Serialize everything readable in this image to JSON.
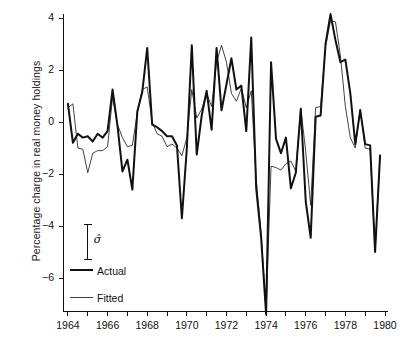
{
  "chart_data": {
    "type": "line",
    "title": "",
    "xlabel": "",
    "ylabel": "Percentage charge in real money holdings",
    "xlim": [
      1963.75,
      1980.0
    ],
    "ylim": [
      -7.8,
      4.4
    ],
    "yticks": [
      4,
      2,
      0,
      -2,
      -4,
      -6
    ],
    "ytick_labels": [
      "4",
      "2",
      "0",
      "−2",
      "−4",
      "−6"
    ],
    "xticks": [
      1964,
      1965,
      1966,
      1967,
      1968,
      1969,
      1970,
      1971,
      1972,
      1973,
      1974,
      1975,
      1976,
      1977,
      1978,
      1979,
      1980
    ],
    "xtick_labels_shown": [
      "1964",
      "1966",
      "1968",
      "1970",
      "1972",
      "1974",
      "1976",
      "1978",
      "1980"
    ],
    "xtick_labels_values": [
      1964,
      1966,
      1968,
      1970,
      1972,
      1974,
      1976,
      1978,
      1980
    ],
    "grid": false,
    "legend_position": "lower-left-inside",
    "annotations": [
      {
        "name": "sigma-hat-errorbar",
        "label": "σ̂",
        "x": 1965.0,
        "y_top": -3.95,
        "y_bottom": -5.3
      }
    ],
    "series": [
      {
        "name": "Actual",
        "style": "thick",
        "color": "#111111",
        "linewidth": 2.0,
        "x": [
          1964.0,
          1964.25,
          1964.5,
          1964.75,
          1965.0,
          1965.25,
          1965.5,
          1965.75,
          1966.0,
          1966.25,
          1966.5,
          1966.75,
          1967.0,
          1967.25,
          1967.5,
          1967.75,
          1968.0,
          1968.25,
          1968.5,
          1968.75,
          1969.0,
          1969.25,
          1969.5,
          1969.75,
          1970.0,
          1970.25,
          1970.5,
          1970.75,
          1971.0,
          1971.25,
          1971.5,
          1971.75,
          1972.0,
          1972.25,
          1972.5,
          1972.75,
          1973.0,
          1973.25,
          1973.5,
          1973.75,
          1974.0,
          1974.25,
          1974.5,
          1974.75,
          1975.0,
          1975.25,
          1975.5,
          1975.75,
          1976.0,
          1976.25,
          1976.5,
          1976.75,
          1977.0,
          1977.25,
          1977.5,
          1977.75,
          1978.0,
          1978.25,
          1978.5,
          1978.75,
          1979.0,
          1979.25,
          1979.5,
          1979.75
        ],
        "y": [
          0.7,
          -0.8,
          -0.45,
          -0.6,
          -0.55,
          -0.75,
          -0.45,
          -0.6,
          -0.35,
          1.25,
          -0.15,
          -1.9,
          -1.45,
          -2.6,
          0.4,
          1.15,
          2.85,
          -0.1,
          -0.2,
          -0.35,
          -0.55,
          -0.55,
          -0.9,
          -3.7,
          -1.0,
          2.95,
          -1.25,
          0.25,
          1.2,
          -0.3,
          2.85,
          0.45,
          1.45,
          2.45,
          1.25,
          1.4,
          -0.35,
          3.25,
          -2.55,
          -4.45,
          -7.4,
          2.3,
          -0.65,
          -1.2,
          -0.6,
          -2.55,
          -1.95,
          0.5,
          -3.05,
          -4.45,
          0.2,
          0.25,
          3.0,
          4.15,
          3.15,
          2.3,
          2.4,
          1.1,
          -0.85,
          0.45,
          -0.85,
          -0.9,
          -5.0,
          -1.3
        ]
      },
      {
        "name": "Fitted",
        "style": "thin",
        "color": "#111111",
        "linewidth": 0.8,
        "x": [
          1964.0,
          1964.25,
          1964.5,
          1964.75,
          1965.0,
          1965.25,
          1965.5,
          1965.75,
          1966.0,
          1966.25,
          1966.5,
          1966.75,
          1967.0,
          1967.25,
          1967.5,
          1967.75,
          1968.0,
          1968.25,
          1968.5,
          1968.75,
          1969.0,
          1969.25,
          1969.5,
          1969.75,
          1970.0,
          1970.25,
          1970.5,
          1970.75,
          1971.0,
          1971.25,
          1971.5,
          1971.75,
          1972.0,
          1972.25,
          1972.5,
          1972.75,
          1973.0,
          1973.25,
          1973.5,
          1973.75,
          1974.0,
          1974.25,
          1974.5,
          1974.75,
          1975.0,
          1975.25,
          1975.5,
          1975.75,
          1976.0,
          1976.25,
          1976.5,
          1976.75,
          1977.0,
          1977.25,
          1977.5,
          1977.75,
          1978.0,
          1978.25,
          1978.5,
          1978.75,
          1979.0,
          1979.25,
          1979.5,
          1979.75
        ],
        "y": [
          0.55,
          0.7,
          -1.0,
          -1.05,
          -1.95,
          -1.2,
          -1.1,
          -1.1,
          -0.95,
          0.95,
          -0.1,
          -0.6,
          -0.95,
          -0.9,
          0.35,
          1.25,
          1.35,
          0.0,
          -0.45,
          -0.55,
          -0.95,
          -0.85,
          -1.0,
          -1.3,
          -0.6,
          1.25,
          0.15,
          0.5,
          1.1,
          0.6,
          2.3,
          2.95,
          2.3,
          1.1,
          0.8,
          1.3,
          0.55,
          1.2,
          -2.2,
          -4.3,
          -7.3,
          -1.7,
          -1.75,
          -1.85,
          -1.6,
          -1.5,
          -1.9,
          0.55,
          -1.15,
          -3.2,
          0.55,
          0.6,
          2.9,
          3.9,
          3.85,
          2.55,
          0.6,
          -0.6,
          -1.0,
          0.5,
          -1.0,
          -1.05,
          -4.9,
          -1.25
        ]
      }
    ]
  },
  "legend": {
    "items": [
      {
        "label": "Actual",
        "style": "thick"
      },
      {
        "label": "Fitted",
        "style": "thin"
      }
    ],
    "sigma_symbol": "σ̂"
  },
  "axes": {
    "y_label": "Percentage charge in real money holdings",
    "y_tick_labels": [
      "4",
      "2",
      "0",
      "−2",
      "−4",
      "−6"
    ],
    "x_tick_labels": [
      "1964",
      "1966",
      "1968",
      "1970",
      "1972",
      "1974",
      "1976",
      "1978",
      "1980"
    ]
  }
}
